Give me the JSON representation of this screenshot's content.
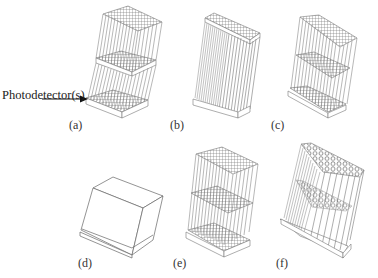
{
  "figure": {
    "callout_label": "Photodetector(s)",
    "panels": [
      {
        "id": "a",
        "label": "(a)",
        "description": "two stacked fiber-array blocks with photodetector plates"
      },
      {
        "id": "b",
        "label": "(b)",
        "description": "single dense fiber-array block"
      },
      {
        "id": "c",
        "label": "(c)",
        "description": "fiber array with three grid layers"
      },
      {
        "id": "d",
        "label": "(d)",
        "description": "solid block on base plate"
      },
      {
        "id": "e",
        "label": "(e)",
        "description": "fiber array with three grid layers and lower photodetector"
      },
      {
        "id": "f",
        "label": "(f)",
        "description": "hexagonal fiber array with honeycomb layers"
      }
    ]
  }
}
